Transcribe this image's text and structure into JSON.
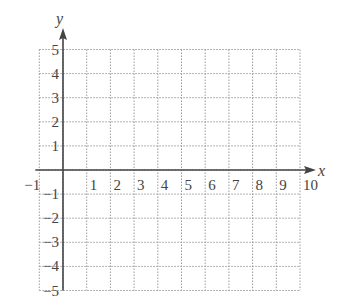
{
  "chart_data": {
    "type": "coordinate-grid",
    "title": "",
    "xlabel": "x",
    "ylabel": "y",
    "xlim": [
      -1,
      10
    ],
    "ylim": [
      -5,
      5
    ],
    "grid": true,
    "grid_style": "dotted",
    "x_ticks": [
      "−1",
      "1",
      "2",
      "3",
      "4",
      "5",
      "6",
      "7",
      "8",
      "9",
      "10"
    ],
    "y_ticks": [
      "5",
      "4",
      "3",
      "2",
      "1",
      "−1",
      "−2",
      "−3",
      "−4",
      "−5"
    ],
    "x_tick_values": [
      -1,
      1,
      2,
      3,
      4,
      5,
      6,
      7,
      8,
      9,
      10
    ],
    "y_tick_values": [
      5,
      4,
      3,
      2,
      1,
      -1,
      -2,
      -3,
      -4,
      -5
    ],
    "series": []
  },
  "colors": {
    "axis": "#444444",
    "grid": "#9a9a9a",
    "text": "#444444"
  }
}
